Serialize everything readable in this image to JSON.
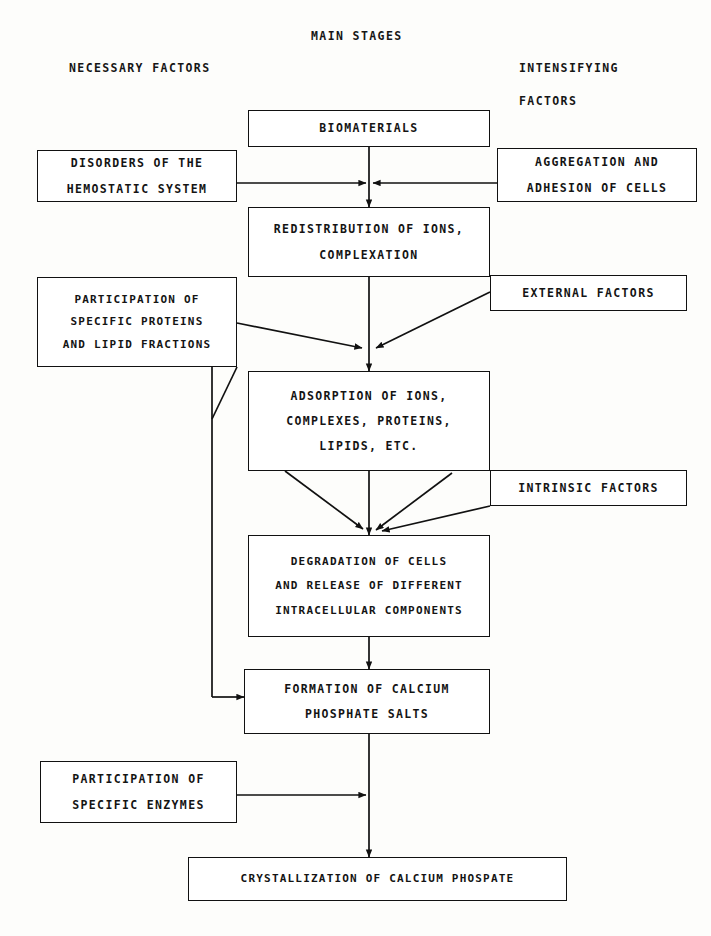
{
  "diagram": {
    "title": "MAIN STAGES",
    "column_headers": {
      "left": "NECESSARY FACTORS",
      "right_line1": "INTENSIFYING",
      "right_line2": "FACTORS"
    },
    "main_stages": [
      {
        "id": "biomaterials",
        "lines": [
          "BIOMATERIALS"
        ]
      },
      {
        "id": "redistribution",
        "lines": [
          "REDISTRIBUTION OF IONS,",
          "COMPLEXATION"
        ]
      },
      {
        "id": "adsorption",
        "lines": [
          "ADSORPTION OF IONS,",
          "COMPLEXES, PROTEINS,",
          "LIPIDS, ETC."
        ]
      },
      {
        "id": "degradation",
        "lines": [
          "DEGRADATION OF CELLS",
          "AND RELEASE OF DIFFERENT",
          "INTRACELLULAR COMPONENTS"
        ]
      },
      {
        "id": "formation",
        "lines": [
          "FORMATION OF CALCIUM",
          "PHOSPHATE SALTS"
        ]
      },
      {
        "id": "crystallization",
        "lines": [
          "CRYSTALLIZATION OF CALCIUM PHOSPATE"
        ]
      }
    ],
    "necessary_factors": [
      {
        "id": "disorders",
        "lines": [
          "DISORDERS OF THE",
          "HEMOSTATIC SYSTEM"
        ]
      },
      {
        "id": "proteins",
        "lines": [
          "PARTICIPATION OF",
          "SPECIFIC PROTEINS",
          "AND LIPID FRACTIONS"
        ]
      },
      {
        "id": "enzymes",
        "lines": [
          "PARTICIPATION OF",
          "SPECIFIC ENZYMES"
        ]
      }
    ],
    "intensifying_factors": [
      {
        "id": "aggregation",
        "lines": [
          "AGGREGATION AND",
          "ADHESION OF CELLS"
        ]
      },
      {
        "id": "external",
        "lines": [
          "EXTERNAL FACTORS"
        ]
      },
      {
        "id": "intrinsic",
        "lines": [
          "INTRINSIC FACTORS"
        ]
      }
    ],
    "colors": {
      "line": "#111111",
      "background": "#fdfdfb",
      "text": "#141414"
    }
  }
}
